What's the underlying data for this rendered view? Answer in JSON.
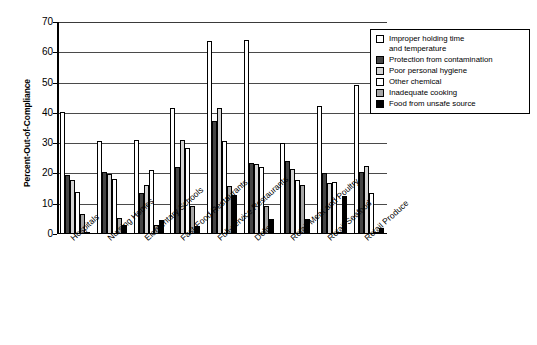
{
  "chart_data": {
    "type": "bar",
    "title": "",
    "xlabel": "",
    "ylabel": "Percent-Out-of-Compliance",
    "ylim": [
      0,
      70
    ],
    "yticks": [
      0,
      10,
      20,
      30,
      40,
      50,
      60,
      70
    ],
    "grid": true,
    "legend_position": "top-right",
    "categories": [
      "Hospitals",
      "Nursing Homes",
      "Elementary Schools",
      "Fast-Food Restaurants",
      "Full-service Restaurants",
      "Delis",
      "Retail Meat and Poultry",
      "Retail Seafood",
      "Retail Produce"
    ],
    "series": [
      {
        "name": "Improper holding time\nand temperature",
        "color": "#ffffff",
        "values": [
          40.2,
          30.6,
          31.0,
          41.5,
          63.8,
          64.2,
          30.0,
          42.3,
          49.1
        ]
      },
      {
        "name": "Protection from contamination",
        "color": "#444444",
        "values": [
          19.5,
          20.4,
          13.4,
          22.0,
          37.3,
          23.6,
          24.2,
          20.0,
          20.5
        ]
      },
      {
        "name": "Poor personal hygiene",
        "color": "#d4d4d4",
        "values": [
          17.8,
          19.9,
          16.1,
          31.2,
          41.6,
          23.2,
          21.4,
          16.8,
          22.3
        ]
      },
      {
        "name": "Other chemical",
        "color": "#ffffff",
        "values": [
          13.8,
          18.1,
          21.1,
          28.4,
          30.6,
          22.0,
          18.0,
          17.2,
          13.4
        ]
      },
      {
        "name": "Inadequate cooking",
        "color": "#a6a6a6",
        "values": [
          6.6,
          5.2,
          3.1,
          9.1,
          15.7,
          9.2,
          16.1,
          0.4,
          0.5
        ]
      },
      {
        "name": "Food from unsafe source",
        "color": "#000000",
        "values": [
          0.5,
          3.1,
          4.5,
          2.5,
          12.8,
          5.0,
          5.0,
          12.5,
          2.0
        ]
      }
    ]
  },
  "axis": {
    "y_title": "Percent-Out-of-Compliance"
  }
}
